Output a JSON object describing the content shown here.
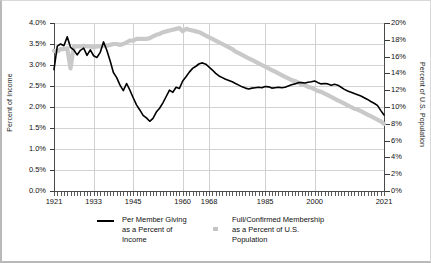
{
  "chart_data": {
    "type": "line",
    "title": "",
    "subtitle": "",
    "xlabel": "",
    "ylabel": "Percent of Income",
    "y2label": "Percent of U.S. Population",
    "xlim": [
      1921,
      2021
    ],
    "ylim": [
      0.0,
      4.0
    ],
    "y2lim": [
      0,
      20
    ],
    "grid": true,
    "legend_position": "bottom",
    "x_ticks": [
      1921,
      1933,
      1945,
      1960,
      1968,
      1985,
      2000,
      2021
    ],
    "x_tick_labels": [
      "1921",
      "1933",
      "1945",
      "1960",
      "1968",
      "1985",
      "2000",
      "2021"
    ],
    "y_ticks": [
      0.0,
      0.5,
      1.0,
      1.5,
      2.0,
      2.5,
      3.0,
      3.5,
      4.0
    ],
    "y_tick_labels": [
      "0.0%",
      "0.5%",
      "1.0%",
      "1.5%",
      "2.0%",
      "2.5%",
      "3.0%",
      "3.5%",
      "4.0%"
    ],
    "y2_ticks": [
      0,
      2,
      4,
      6,
      8,
      10,
      12,
      14,
      16,
      18,
      20
    ],
    "y2_tick_labels": [
      "0%",
      "2%",
      "4%",
      "6%",
      "8%",
      "10%",
      "12%",
      "14%",
      "16%",
      "18%",
      "20%"
    ],
    "series": [
      {
        "name": "Per Member Giving as a Percent of Income",
        "axis": "left",
        "color": "#000000",
        "style": "solid",
        "width": 1.6,
        "x": [
          1921,
          1922,
          1923,
          1924,
          1925,
          1926,
          1927,
          1928,
          1929,
          1930,
          1931,
          1932,
          1933,
          1934,
          1935,
          1936,
          1937,
          1938,
          1939,
          1940,
          1941,
          1942,
          1943,
          1944,
          1945,
          1946,
          1947,
          1948,
          1949,
          1950,
          1951,
          1952,
          1953,
          1954,
          1955,
          1956,
          1957,
          1958,
          1959,
          1960,
          1961,
          1962,
          1963,
          1964,
          1965,
          1966,
          1967,
          1968,
          1969,
          1970,
          1971,
          1972,
          1973,
          1974,
          1975,
          1976,
          1977,
          1978,
          1979,
          1980,
          1981,
          1982,
          1983,
          1984,
          1985,
          1986,
          1987,
          1988,
          1989,
          1990,
          1991,
          1992,
          1993,
          1994,
          1995,
          1996,
          1997,
          1998,
          1999,
          2000,
          2001,
          2002,
          2003,
          2004,
          2005,
          2006,
          2007,
          2008,
          2009,
          2010,
          2011,
          2012,
          2013,
          2014,
          2015,
          2016,
          2017,
          2018,
          2019,
          2020,
          2021
        ],
        "values": [
          2.89,
          3.45,
          3.5,
          3.46,
          3.67,
          3.42,
          3.36,
          3.24,
          3.35,
          3.4,
          3.23,
          3.36,
          3.22,
          3.18,
          3.3,
          3.55,
          3.35,
          3.1,
          2.82,
          2.7,
          2.52,
          2.39,
          2.56,
          2.4,
          2.22,
          2.05,
          1.93,
          1.8,
          1.74,
          1.66,
          1.73,
          1.88,
          1.97,
          2.1,
          2.25,
          2.4,
          2.35,
          2.47,
          2.44,
          2.62,
          2.72,
          2.83,
          2.92,
          2.97,
          3.03,
          3.05,
          3.02,
          2.95,
          2.88,
          2.8,
          2.74,
          2.7,
          2.66,
          2.63,
          2.6,
          2.56,
          2.52,
          2.48,
          2.45,
          2.43,
          2.45,
          2.46,
          2.47,
          2.46,
          2.49,
          2.48,
          2.45,
          2.46,
          2.47,
          2.46,
          2.47,
          2.5,
          2.53,
          2.55,
          2.58,
          2.58,
          2.57,
          2.59,
          2.6,
          2.62,
          2.58,
          2.55,
          2.56,
          2.55,
          2.52,
          2.54,
          2.52,
          2.47,
          2.42,
          2.38,
          2.35,
          2.32,
          2.29,
          2.26,
          2.22,
          2.18,
          2.13,
          2.09,
          2.04,
          1.92,
          1.81
        ]
      },
      {
        "name": "Full/Confirmed Membership as a Percent of U.S. Population",
        "axis": "right",
        "color": "#c9c9c9",
        "style": "solid",
        "width": 4.2,
        "x": [
          1921,
          1922,
          1923,
          1924,
          1925,
          1926,
          1927,
          1928,
          1929,
          1930,
          1931,
          1932,
          1933,
          1934,
          1935,
          1936,
          1937,
          1938,
          1939,
          1940,
          1941,
          1942,
          1943,
          1944,
          1945,
          1946,
          1947,
          1948,
          1949,
          1950,
          1951,
          1952,
          1953,
          1954,
          1955,
          1956,
          1957,
          1958,
          1959,
          1960,
          1961,
          1962,
          1963,
          1964,
          1965,
          1966,
          1967,
          1968,
          1969,
          1970,
          1971,
          1972,
          1973,
          1974,
          1975,
          1976,
          1977,
          1978,
          1979,
          1980,
          1981,
          1982,
          1983,
          1984,
          1985,
          1986,
          1987,
          1988,
          1989,
          1990,
          1991,
          1992,
          1993,
          1994,
          1995,
          1996,
          1997,
          1998,
          1999,
          2000,
          2001,
          2002,
          2003,
          2004,
          2005,
          2006,
          2007,
          2008,
          2009,
          2010,
          2011,
          2012,
          2013,
          2014,
          2015,
          2016,
          2017,
          2018,
          2019,
          2020,
          2021
        ],
        "values": [
          16.7,
          16.6,
          16.9,
          16.9,
          17.0,
          14.6,
          17.2,
          17.2,
          17.2,
          17.3,
          17.2,
          17.2,
          17.1,
          17.2,
          17.2,
          17.3,
          17.3,
          17.4,
          17.5,
          17.5,
          17.4,
          17.5,
          17.7,
          17.9,
          17.9,
          18.1,
          18.1,
          18.1,
          18.1,
          18.2,
          18.4,
          18.6,
          18.7,
          18.9,
          19.0,
          19.1,
          19.2,
          19.3,
          19.4,
          19.0,
          19.3,
          19.2,
          19.1,
          19.0,
          18.9,
          18.7,
          18.5,
          18.3,
          18.1,
          17.9,
          17.7,
          17.5,
          17.3,
          17.1,
          16.9,
          16.6,
          16.4,
          16.2,
          16.0,
          15.8,
          15.6,
          15.4,
          15.2,
          15.0,
          14.8,
          14.6,
          14.4,
          14.2,
          14.0,
          13.8,
          13.6,
          13.4,
          13.2,
          13.1,
          12.9,
          12.7,
          12.6,
          12.4,
          12.3,
          12.1,
          11.9,
          11.8,
          11.6,
          11.4,
          11.2,
          11.0,
          10.8,
          10.6,
          10.4,
          10.2,
          10.0,
          9.8,
          9.7,
          9.5,
          9.3,
          9.1,
          8.9,
          8.7,
          8.5,
          8.3,
          8.0
        ]
      }
    ],
    "legend": [
      {
        "label_lines": [
          "Per Member Giving",
          "as a Percent of",
          "Income"
        ],
        "marker": "line",
        "color": "#000000"
      },
      {
        "label_lines": [
          "Full/Confirmed Membership",
          "as a Percent of U.S.",
          "Population"
        ],
        "marker": "square",
        "color": "#c4c4c4"
      }
    ]
  },
  "colors": {
    "giving_line": "#000000",
    "membership_line": "#c9c9c9",
    "grid": "#d3d3d3",
    "axis": "#4a4a4a",
    "text": "#111111",
    "background": "#ffffff"
  }
}
